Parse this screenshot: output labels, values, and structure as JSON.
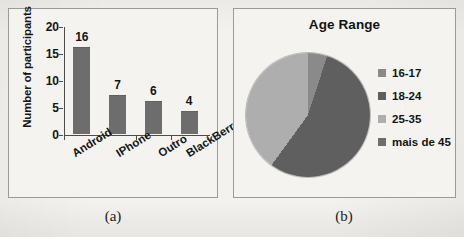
{
  "figure": {
    "caption_a": "(a)",
    "caption_b": "(b)"
  },
  "chart_data": [
    {
      "type": "bar",
      "panel": "a",
      "title": "",
      "categories": [
        "Android",
        "IPhone",
        "Outro",
        "BlackBerry"
      ],
      "values": [
        16,
        7,
        6,
        4
      ],
      "data_labels": [
        "16",
        "7",
        "6",
        "4"
      ],
      "xlabel": "",
      "ylabel": "Number of participants",
      "ylim": [
        0,
        20
      ],
      "yticks": [
        0,
        5,
        10,
        15,
        20
      ],
      "ytick_labels": [
        "0",
        "5",
        "10",
        "15",
        "20"
      ],
      "grid": false,
      "legend": "none",
      "bar_color": "#6d6d6d",
      "axis_color": "#4c4c4c"
    },
    {
      "type": "pie",
      "panel": "b",
      "title": "Age Range",
      "labels": [
        "16-17",
        "18-24",
        "25-35",
        "mais de 45"
      ],
      "values": [
        5,
        55,
        40,
        0
      ],
      "colors": [
        "#8a8a8a",
        "#5f5f5f",
        "#aeaeae",
        "#6d6d6d"
      ],
      "legend_position": "right",
      "start_angle": 0
    }
  ]
}
